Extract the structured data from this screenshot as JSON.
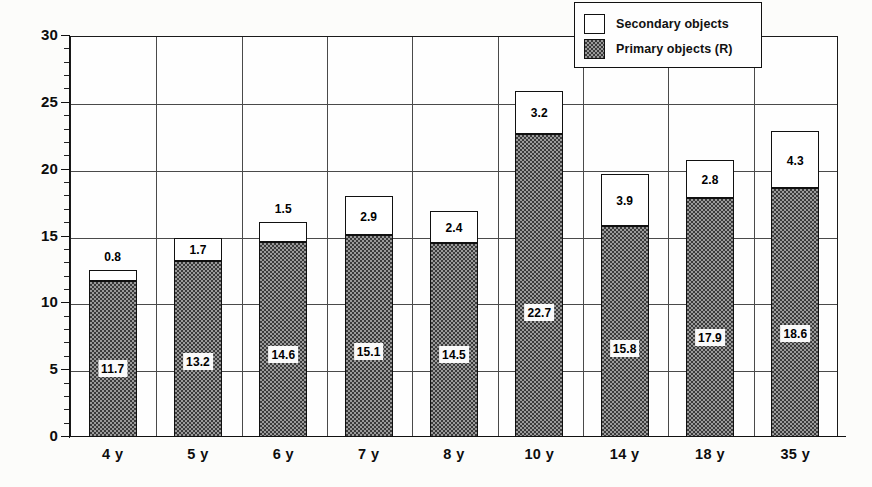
{
  "chart_data": {
    "type": "bar",
    "subtype": "stacked-bar",
    "title": "",
    "xlabel": "",
    "ylabel": "",
    "ylim": [
      0,
      30
    ],
    "y_major_step": 5,
    "y_minor_step": 1,
    "grid": "major-horizontal-and-category-vertical",
    "legend_position": "top-right-inside",
    "categories": [
      "4 y",
      "5 y",
      "6 y",
      "7 y",
      "8 y",
      "10 y",
      "14 y",
      "18 y",
      "35 y"
    ],
    "series": [
      {
        "name": "Primary objects (R)",
        "fill": "dark-checker",
        "values": [
          11.7,
          13.2,
          14.6,
          15.1,
          14.5,
          22.7,
          15.8,
          17.9,
          18.6
        ]
      },
      {
        "name": "Secondary objects",
        "fill": "white",
        "values": [
          0.8,
          1.7,
          1.5,
          2.9,
          2.4,
          3.2,
          3.9,
          2.8,
          4.3
        ]
      }
    ],
    "totals": [
      12.5,
      14.9,
      16.1,
      18.0,
      16.9,
      25.9,
      19.7,
      20.7,
      22.9
    ],
    "y_tick_labels": [
      "0",
      "5",
      "10",
      "15",
      "20",
      "25",
      "30"
    ],
    "data_labels": {
      "primary": [
        "11.7",
        "13.2",
        "14.6",
        "15.1",
        "14.5",
        "22.7",
        "15.8",
        "17.9",
        "18.6"
      ],
      "secondary": [
        "0.8",
        "1.7",
        "1.5",
        "2.9",
        "2.4",
        "3.2",
        "3.9",
        "2.8",
        "4.3"
      ]
    }
  },
  "legend": {
    "items": [
      {
        "label": "Secondary objects",
        "swatch": "white-box"
      },
      {
        "label": "Primary objects (R)",
        "swatch": "dark-checker-box"
      }
    ]
  },
  "colors": {
    "axis": "#111111",
    "gridline": "#4a4a4a",
    "primary_fill": "#5d5d5d",
    "secondary_fill": "#ffffff",
    "background": "#fdfdfb",
    "label_text": "#0d0d0d"
  }
}
